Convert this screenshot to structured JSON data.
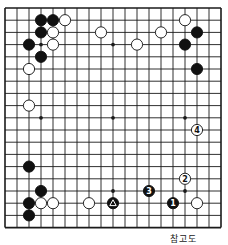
{
  "diagram": {
    "type": "go-board",
    "size": 19,
    "caption": "참고도",
    "colors": {
      "line": "#1a1a1a",
      "black": "#111111",
      "white": "#ffffff",
      "background": "#ffffff"
    },
    "star_points": [
      [
        3,
        3
      ],
      [
        9,
        3
      ],
      [
        15,
        3
      ],
      [
        3,
        9
      ],
      [
        9,
        9
      ],
      [
        15,
        9
      ],
      [
        3,
        15
      ],
      [
        9,
        15
      ],
      [
        15,
        15
      ]
    ],
    "stones": [
      {
        "col": 3,
        "row": 1,
        "color": "black"
      },
      {
        "col": 4,
        "row": 1,
        "color": "black"
      },
      {
        "col": 5,
        "row": 1,
        "color": "white"
      },
      {
        "col": 3,
        "row": 2,
        "color": "black"
      },
      {
        "col": 4,
        "row": 2,
        "color": "white"
      },
      {
        "col": 2,
        "row": 3,
        "color": "black"
      },
      {
        "col": 4,
        "row": 3,
        "color": "white"
      },
      {
        "col": 3,
        "row": 4,
        "color": "black"
      },
      {
        "col": 2,
        "row": 5,
        "color": "white"
      },
      {
        "col": 2,
        "row": 8,
        "color": "white"
      },
      {
        "col": 8,
        "row": 2,
        "color": "white"
      },
      {
        "col": 11,
        "row": 3,
        "color": "white"
      },
      {
        "col": 13,
        "row": 2,
        "color": "white"
      },
      {
        "col": 15,
        "row": 1,
        "color": "white"
      },
      {
        "col": 16,
        "row": 2,
        "color": "black"
      },
      {
        "col": 15,
        "row": 3,
        "color": "black"
      },
      {
        "col": 16,
        "row": 5,
        "color": "black"
      },
      {
        "col": 16,
        "row": 10,
        "color": "white",
        "label": "4"
      },
      {
        "col": 15,
        "row": 14,
        "color": "white",
        "label": "2"
      },
      {
        "col": 12,
        "row": 15,
        "color": "black",
        "label": "3"
      },
      {
        "col": 14,
        "row": 16,
        "color": "black",
        "label": "1"
      },
      {
        "col": 16,
        "row": 16,
        "color": "white"
      },
      {
        "col": 9,
        "row": 16,
        "color": "black",
        "marker": "triangle"
      },
      {
        "col": 7,
        "row": 16,
        "color": "white"
      },
      {
        "col": 4,
        "row": 16,
        "color": "white"
      },
      {
        "col": 3,
        "row": 16,
        "color": "white"
      },
      {
        "col": 2,
        "row": 16,
        "color": "black"
      },
      {
        "col": 3,
        "row": 15,
        "color": "black"
      },
      {
        "col": 2,
        "row": 13,
        "color": "black"
      },
      {
        "col": 2,
        "row": 17,
        "color": "black"
      }
    ]
  }
}
